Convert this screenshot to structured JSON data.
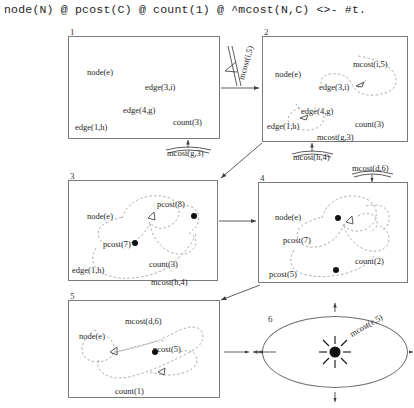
{
  "header": {
    "formula": "node(N) @ pcost(C) @ count(1) @ ^mcost(N,C) <>- #t."
  },
  "panels": [
    {
      "number": "1",
      "atoms": [
        {
          "text": "node(e)",
          "x": 18,
          "y": 30
        },
        {
          "text": "edge(3,i)",
          "x": 76,
          "y": 45
        },
        {
          "text": "edge(4,g)",
          "x": 54,
          "y": 68
        },
        {
          "text": "edge(1,h)",
          "x": 6,
          "y": 85
        },
        {
          "text": "count(3)",
          "x": 104,
          "y": 80
        }
      ]
    },
    {
      "number": "2",
      "atoms": [
        {
          "text": "node(e)",
          "x": 12,
          "y": 32
        },
        {
          "text": "mcost(i,5)",
          "x": 94,
          "y": 24
        },
        {
          "text": "edge(3,i)",
          "x": 56,
          "y": 45
        },
        {
          "text": "edge(4,g)",
          "x": 38,
          "y": 69
        },
        {
          "text": "edge(1,h)",
          "x": 4,
          "y": 84
        },
        {
          "text": "count(3)",
          "x": 92,
          "y": 82
        },
        {
          "text": "mcost(g,3)",
          "x": 54,
          "y": 97
        }
      ]
    },
    {
      "number": "3",
      "atoms": [
        {
          "text": "node(e)",
          "x": 18,
          "y": 30
        },
        {
          "text": "pcost(8)",
          "x": 90,
          "y": 20
        },
        {
          "text": "pcost(7)",
          "x": 36,
          "y": 58
        },
        {
          "text": "edge(1,h)",
          "x": 5,
          "y": 86
        },
        {
          "text": "count(3)",
          "x": 82,
          "y": 80
        },
        {
          "text": "mcost(h,4)",
          "x": 84,
          "y": 99
        }
      ]
    },
    {
      "number": "4",
      "atoms": [
        {
          "text": "node(e)",
          "x": 18,
          "y": 31
        },
        {
          "text": "pcost(7)",
          "x": 26,
          "y": 54
        },
        {
          "text": "count(2)",
          "x": 96,
          "y": 75
        },
        {
          "text": "pcost(5)",
          "x": 12,
          "y": 89
        }
      ]
    },
    {
      "number": "5",
      "atoms": [
        {
          "text": "mcost(d,6)",
          "x": 58,
          "y": 17
        },
        {
          "text": "node(e)",
          "x": 12,
          "y": 32
        },
        {
          "text": "pcost(5)",
          "x": 84,
          "y": 45
        },
        {
          "text": "count(1)",
          "x": 48,
          "y": 89
        }
      ]
    },
    {
      "number": "6",
      "atoms": []
    }
  ],
  "edge_labels": [
    {
      "name": "label-mcost-i5",
      "text": "mcost(i,5)"
    },
    {
      "name": "label-mcost-g3",
      "text": "mcost(g,3)"
    },
    {
      "name": "label-mcost-h4",
      "text": "mcost(h,4)"
    },
    {
      "name": "label-mcost-d6",
      "text": "mcost(d,6)"
    },
    {
      "name": "label-mcost-e5",
      "text": "mcost(e,5)"
    }
  ]
}
